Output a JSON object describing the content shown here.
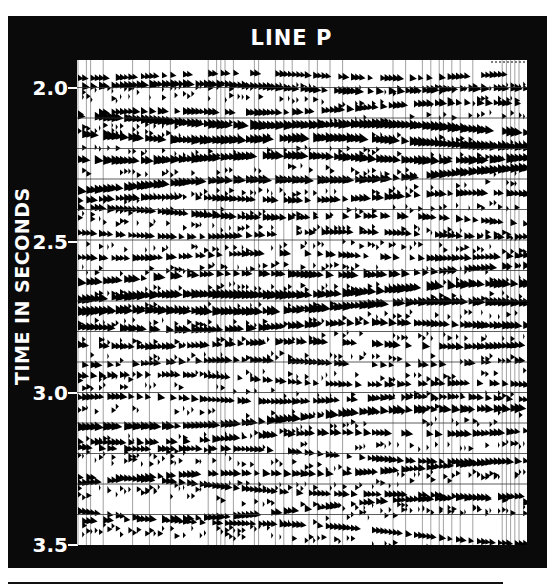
{
  "figure": {
    "title": "LINE P",
    "y_axis_label": "TIME IN SECONDS",
    "y_ticks": [
      {
        "label": "2.0",
        "value": 2.0
      },
      {
        "label": "2.5",
        "value": 2.5
      },
      {
        "label": "3.0",
        "value": 3.0
      },
      {
        "label": "3.5",
        "value": 3.5
      }
    ],
    "time_range": [
      1.91,
      3.5
    ],
    "timing_line_interval_s": 0.1,
    "display": "variable-area wiggle-trace seismic section",
    "colors": {
      "frame": "#0a0a0a",
      "text": "#ffffff",
      "trace_fill": "#000000",
      "background": "#ffffff"
    },
    "reflectors": [
      {
        "t": 1.96,
        "strength": 0.5,
        "dip": 0.0
      },
      {
        "t": 2.0,
        "strength": 0.7,
        "dip": 0.01
      },
      {
        "t": 2.07,
        "strength": 0.6,
        "dip": -0.02
      },
      {
        "t": 2.12,
        "strength": 0.95,
        "dip": 0.02
      },
      {
        "t": 2.17,
        "strength": 0.95,
        "dip": 0.015
      },
      {
        "t": 2.23,
        "strength": 0.9,
        "dip": 0.0
      },
      {
        "t": 2.3,
        "strength": 0.85,
        "dip": -0.03
      },
      {
        "t": 2.36,
        "strength": 0.6,
        "dip": -0.01
      },
      {
        "t": 2.42,
        "strength": 0.6,
        "dip": 0.02
      },
      {
        "t": 2.48,
        "strength": 0.5,
        "dip": 0.0
      },
      {
        "t": 2.55,
        "strength": 0.55,
        "dip": 0.0
      },
      {
        "t": 2.61,
        "strength": 0.7,
        "dip": -0.02
      },
      {
        "t": 2.67,
        "strength": 0.95,
        "dip": -0.025
      },
      {
        "t": 2.72,
        "strength": 0.9,
        "dip": -0.02
      },
      {
        "t": 2.78,
        "strength": 0.7,
        "dip": -0.01
      },
      {
        "t": 2.84,
        "strength": 0.6,
        "dip": 0.0
      },
      {
        "t": 2.9,
        "strength": 0.55,
        "dip": 0.0
      },
      {
        "t": 2.96,
        "strength": 0.5,
        "dip": 0.02
      },
      {
        "t": 3.02,
        "strength": 0.55,
        "dip": 0.0
      },
      {
        "t": 3.08,
        "strength": 0.8,
        "dip": -0.04
      },
      {
        "t": 3.14,
        "strength": 0.6,
        "dip": -0.02
      },
      {
        "t": 3.2,
        "strength": 0.55,
        "dip": 0.03
      },
      {
        "t": 3.26,
        "strength": 0.6,
        "dip": -0.03
      },
      {
        "t": 3.32,
        "strength": 0.55,
        "dip": 0.04
      },
      {
        "t": 3.38,
        "strength": 0.6,
        "dip": -0.05
      },
      {
        "t": 3.44,
        "strength": 0.5,
        "dip": 0.05
      }
    ]
  }
}
